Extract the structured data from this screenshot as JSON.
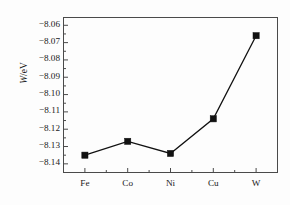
{
  "chart_data": {
    "type": "line",
    "title": "",
    "subtitle": "",
    "xlabel": "",
    "ylabel": "W/eV",
    "ylabel_italic_part": "W",
    "ylabel_unit_part": "/eV",
    "categories": [
      "Fe",
      "Co",
      "Ni",
      "Cu",
      "W"
    ],
    "values": [
      -8.135,
      -8.127,
      -8.134,
      -8.114,
      -8.066
    ],
    "series": [
      {
        "name": "W",
        "values": [
          -8.135,
          -8.127,
          -8.134,
          -8.114,
          -8.066
        ]
      }
    ],
    "ylim": [
      -8.145,
      -8.0555
    ],
    "yticks": [
      -8.06,
      -8.07,
      -8.08,
      -8.09,
      -8.1,
      -8.11,
      -8.12,
      -8.13,
      -8.14
    ],
    "ytick_labels": [
      "−8.06",
      "−8.07",
      "−8.08",
      "−8.09",
      "−8.10",
      "−8.11",
      "−8.12",
      "−8.13",
      "−8.14"
    ],
    "xtick_labels": [
      "Fe",
      "Co",
      "Ni",
      "Cu",
      "W"
    ],
    "grid": false,
    "legend": false,
    "legend_position": "none",
    "marker": "filled-square",
    "line_color": "#111111",
    "marker_color": "#111111",
    "background_color": "#fdfdfd",
    "axis_color": "#4a4a4a",
    "minor_ticks": true
  }
}
